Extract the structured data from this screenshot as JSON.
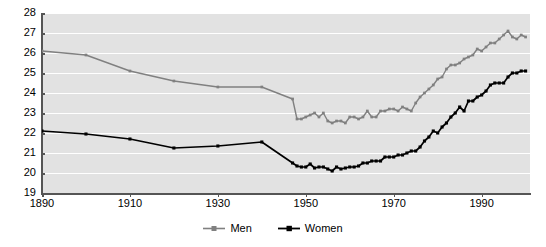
{
  "chart_data": {
    "type": "line",
    "title": "",
    "xlabel": "",
    "ylabel": "",
    "xlim": [
      1890,
      2001
    ],
    "ylim": [
      19,
      28
    ],
    "grid": true,
    "grid_color": "#ffffff",
    "plot_background": "#e2e2e2",
    "legend_position": "bottom-center",
    "y_ticks": [
      19,
      20,
      21,
      22,
      23,
      24,
      25,
      26,
      27,
      28
    ],
    "x_ticks": [
      1890,
      1910,
      1930,
      1950,
      1970,
      1990
    ],
    "series": [
      {
        "name": "Men",
        "color": "#808080",
        "marker": "square",
        "x": [
          1890,
          1900,
          1910,
          1920,
          1930,
          1940,
          1947,
          1948,
          1949,
          1950,
          1951,
          1952,
          1953,
          1954,
          1955,
          1956,
          1957,
          1958,
          1959,
          1960,
          1961,
          1962,
          1963,
          1964,
          1965,
          1966,
          1967,
          1968,
          1969,
          1970,
          1971,
          1972,
          1973,
          1974,
          1975,
          1976,
          1977,
          1978,
          1979,
          1980,
          1981,
          1982,
          1983,
          1984,
          1985,
          1986,
          1987,
          1988,
          1989,
          1990,
          1991,
          1992,
          1993,
          1994,
          1995,
          1996,
          1997,
          1998,
          1999,
          2000
        ],
        "values": [
          26.1,
          25.9,
          25.1,
          24.6,
          24.3,
          24.3,
          23.7,
          22.7,
          22.7,
          22.8,
          22.9,
          23.0,
          22.8,
          23.0,
          22.6,
          22.5,
          22.6,
          22.6,
          22.5,
          22.8,
          22.8,
          22.7,
          22.8,
          23.1,
          22.8,
          22.8,
          23.1,
          23.1,
          23.2,
          23.2,
          23.1,
          23.3,
          23.2,
          23.1,
          23.5,
          23.8,
          24.0,
          24.2,
          24.4,
          24.7,
          24.8,
          25.2,
          25.4,
          25.4,
          25.5,
          25.7,
          25.8,
          25.9,
          26.2,
          26.1,
          26.3,
          26.5,
          26.5,
          26.7,
          26.9,
          27.1,
          26.8,
          26.7,
          26.9,
          26.8
        ],
        "first_value": 26.1,
        "last_value": 26.8,
        "min_value": 22.5,
        "max_value": 27.1
      },
      {
        "name": "Women",
        "color": "#000000",
        "marker": "square",
        "x": [
          1890,
          1900,
          1910,
          1920,
          1930,
          1940,
          1947,
          1948,
          1949,
          1950,
          1951,
          1952,
          1953,
          1954,
          1955,
          1956,
          1957,
          1958,
          1959,
          1960,
          1961,
          1962,
          1963,
          1964,
          1965,
          1966,
          1967,
          1968,
          1969,
          1970,
          1971,
          1972,
          1973,
          1974,
          1975,
          1976,
          1977,
          1978,
          1979,
          1980,
          1981,
          1982,
          1983,
          1984,
          1985,
          1986,
          1987,
          1988,
          1989,
          1990,
          1991,
          1992,
          1993,
          1994,
          1995,
          1996,
          1997,
          1998,
          1999,
          2000
        ],
        "values": [
          22.1,
          21.95,
          21.7,
          21.25,
          21.35,
          21.55,
          20.5,
          20.35,
          20.3,
          20.3,
          20.45,
          20.25,
          20.3,
          20.3,
          20.2,
          20.1,
          20.3,
          20.2,
          20.25,
          20.3,
          20.3,
          20.35,
          20.5,
          20.5,
          20.6,
          20.6,
          20.6,
          20.8,
          20.8,
          20.8,
          20.9,
          20.9,
          21.0,
          21.1,
          21.1,
          21.3,
          21.6,
          21.8,
          22.1,
          22.0,
          22.3,
          22.5,
          22.8,
          23.0,
          23.3,
          23.1,
          23.6,
          23.6,
          23.8,
          23.9,
          24.1,
          24.4,
          24.5,
          24.5,
          24.5,
          24.8,
          25.0,
          25.0,
          25.1,
          25.1
        ],
        "first_value": 22.1,
        "last_value": 25.1,
        "min_value": 20.1,
        "max_value": 25.1
      }
    ]
  },
  "legend": {
    "items": [
      {
        "label": "Men",
        "color": "#808080"
      },
      {
        "label": "Women",
        "color": "#000000"
      }
    ]
  }
}
